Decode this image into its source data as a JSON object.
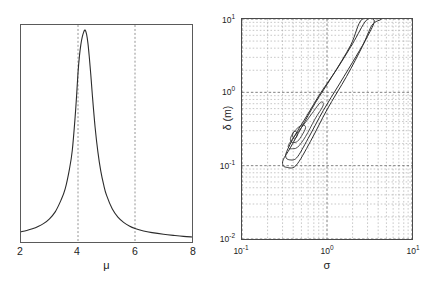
{
  "figure": {
    "panels": [
      "left-marginal-density",
      "right-joint-contour"
    ]
  },
  "left_panel": {
    "xlabel": "μ",
    "xticks": [
      "2",
      "4",
      "6",
      "8"
    ],
    "reference_lines": [
      "4",
      "6"
    ]
  },
  "right_panel": {
    "xlabel": "σ",
    "ylabel": "δ (m)",
    "xticks": [
      "10",
      "10",
      "10"
    ],
    "xtick_exponents": [
      "-1",
      "0",
      "1"
    ],
    "yticks": [
      "10",
      "10",
      "10",
      "10"
    ],
    "ytick_exponents": [
      "1",
      "0",
      "-1",
      "-2"
    ]
  },
  "chart_data": [
    {
      "type": "line",
      "title": "",
      "xlabel": "μ",
      "ylabel": "",
      "xlim": [
        2,
        8
      ],
      "ylim": [
        0,
        1
      ],
      "grid": false,
      "annotations": [
        {
          "type": "vline",
          "x": 4,
          "style": "dashed"
        },
        {
          "type": "vline",
          "x": 6,
          "style": "dashed"
        }
      ],
      "series": [
        {
          "name": "posterior-density-mu",
          "x": [
            2.0,
            2.2,
            2.4,
            2.6,
            2.8,
            3.0,
            3.2,
            3.4,
            3.55,
            3.7,
            3.8,
            3.9,
            3.95,
            4.0,
            4.05,
            4.1,
            4.15,
            4.2,
            4.25,
            4.3,
            4.35,
            4.4,
            4.45,
            4.5,
            4.6,
            4.7,
            4.8,
            4.9,
            5.0,
            5.2,
            5.4,
            5.6,
            5.8,
            6.0,
            6.3,
            6.6,
            7.0,
            7.4,
            7.7,
            8.0
          ],
          "y": [
            0.03,
            0.036,
            0.044,
            0.055,
            0.07,
            0.092,
            0.125,
            0.18,
            0.235,
            0.33,
            0.42,
            0.58,
            0.68,
            0.79,
            0.87,
            0.925,
            0.962,
            0.985,
            0.995,
            0.975,
            0.93,
            0.86,
            0.78,
            0.69,
            0.53,
            0.41,
            0.32,
            0.255,
            0.205,
            0.14,
            0.1,
            0.075,
            0.058,
            0.046,
            0.034,
            0.026,
            0.018,
            0.012,
            0.008,
            0.005
          ]
        }
      ]
    },
    {
      "type": "contour",
      "title": "",
      "xlabel": "σ",
      "ylabel": "δ (m)",
      "xscale": "log",
      "yscale": "log",
      "xlim": [
        0.1,
        10
      ],
      "ylim": [
        0.01,
        10
      ],
      "grid": true,
      "grid_style": "dotted-minor-log",
      "mode_estimate": {
        "sigma": 0.42,
        "delta": 0.25
      },
      "levels": 5,
      "contours": [
        {
          "level": 1,
          "label": "innermost",
          "points": [
            [
              0.415,
              0.232
            ],
            [
              0.432,
              0.24
            ],
            [
              0.444,
              0.256
            ],
            [
              0.445,
              0.274
            ],
            [
              0.436,
              0.288
            ],
            [
              0.42,
              0.294
            ],
            [
              0.404,
              0.288
            ],
            [
              0.395,
              0.272
            ],
            [
              0.394,
              0.254
            ],
            [
              0.402,
              0.239
            ],
            [
              0.415,
              0.232
            ]
          ]
        },
        {
          "level": 2,
          "points": [
            [
              0.4,
              0.205
            ],
            [
              0.45,
              0.215
            ],
            [
              0.51,
              0.262
            ],
            [
              0.56,
              0.33
            ],
            [
              0.52,
              0.36
            ],
            [
              0.455,
              0.33
            ],
            [
              0.4,
              0.28
            ],
            [
              0.372,
              0.236
            ],
            [
              0.378,
              0.212
            ],
            [
              0.4,
              0.205
            ]
          ]
        },
        {
          "level": 3,
          "points": [
            [
              0.382,
              0.17
            ],
            [
              0.45,
              0.178
            ],
            [
              0.56,
              0.25
            ],
            [
              0.72,
              0.43
            ],
            [
              0.9,
              0.66
            ],
            [
              0.84,
              0.73
            ],
            [
              0.67,
              0.52
            ],
            [
              0.52,
              0.35
            ],
            [
              0.41,
              0.248
            ],
            [
              0.352,
              0.19
            ],
            [
              0.36,
              0.172
            ],
            [
              0.382,
              0.17
            ]
          ]
        },
        {
          "level": 4,
          "points": [
            [
              0.358,
              0.12
            ],
            [
              0.44,
              0.128
            ],
            [
              0.6,
              0.235
            ],
            [
              0.9,
              0.56
            ],
            [
              1.4,
              1.3
            ],
            [
              2.2,
              3.1
            ],
            [
              3.0,
              5.8
            ],
            [
              3.6,
              9.4
            ],
            [
              2.9,
              9.6
            ],
            [
              2.0,
              4.6
            ],
            [
              1.3,
              2.05
            ],
            [
              0.85,
              1.0
            ],
            [
              0.58,
              0.48
            ],
            [
              0.42,
              0.26
            ],
            [
              0.335,
              0.155
            ],
            [
              0.33,
              0.128
            ],
            [
              0.358,
              0.12
            ]
          ]
        },
        {
          "level": 5,
          "label": "outermost",
          "points": [
            [
              0.33,
              0.095
            ],
            [
              0.43,
              0.1
            ],
            [
              0.64,
              0.215
            ],
            [
              1.0,
              0.58
            ],
            [
              1.7,
              1.65
            ],
            [
              2.6,
              4.2
            ],
            [
              3.4,
              8.3
            ],
            [
              4.3,
              10.0
            ],
            [
              2.6,
              10.0
            ],
            [
              1.9,
              4.4
            ],
            [
              1.15,
              1.65
            ],
            [
              0.73,
              0.72
            ],
            [
              0.5,
              0.33
            ],
            [
              0.37,
              0.175
            ],
            [
              0.305,
              0.12
            ],
            [
              0.305,
              0.1
            ],
            [
              0.33,
              0.095
            ]
          ]
        }
      ]
    }
  ]
}
